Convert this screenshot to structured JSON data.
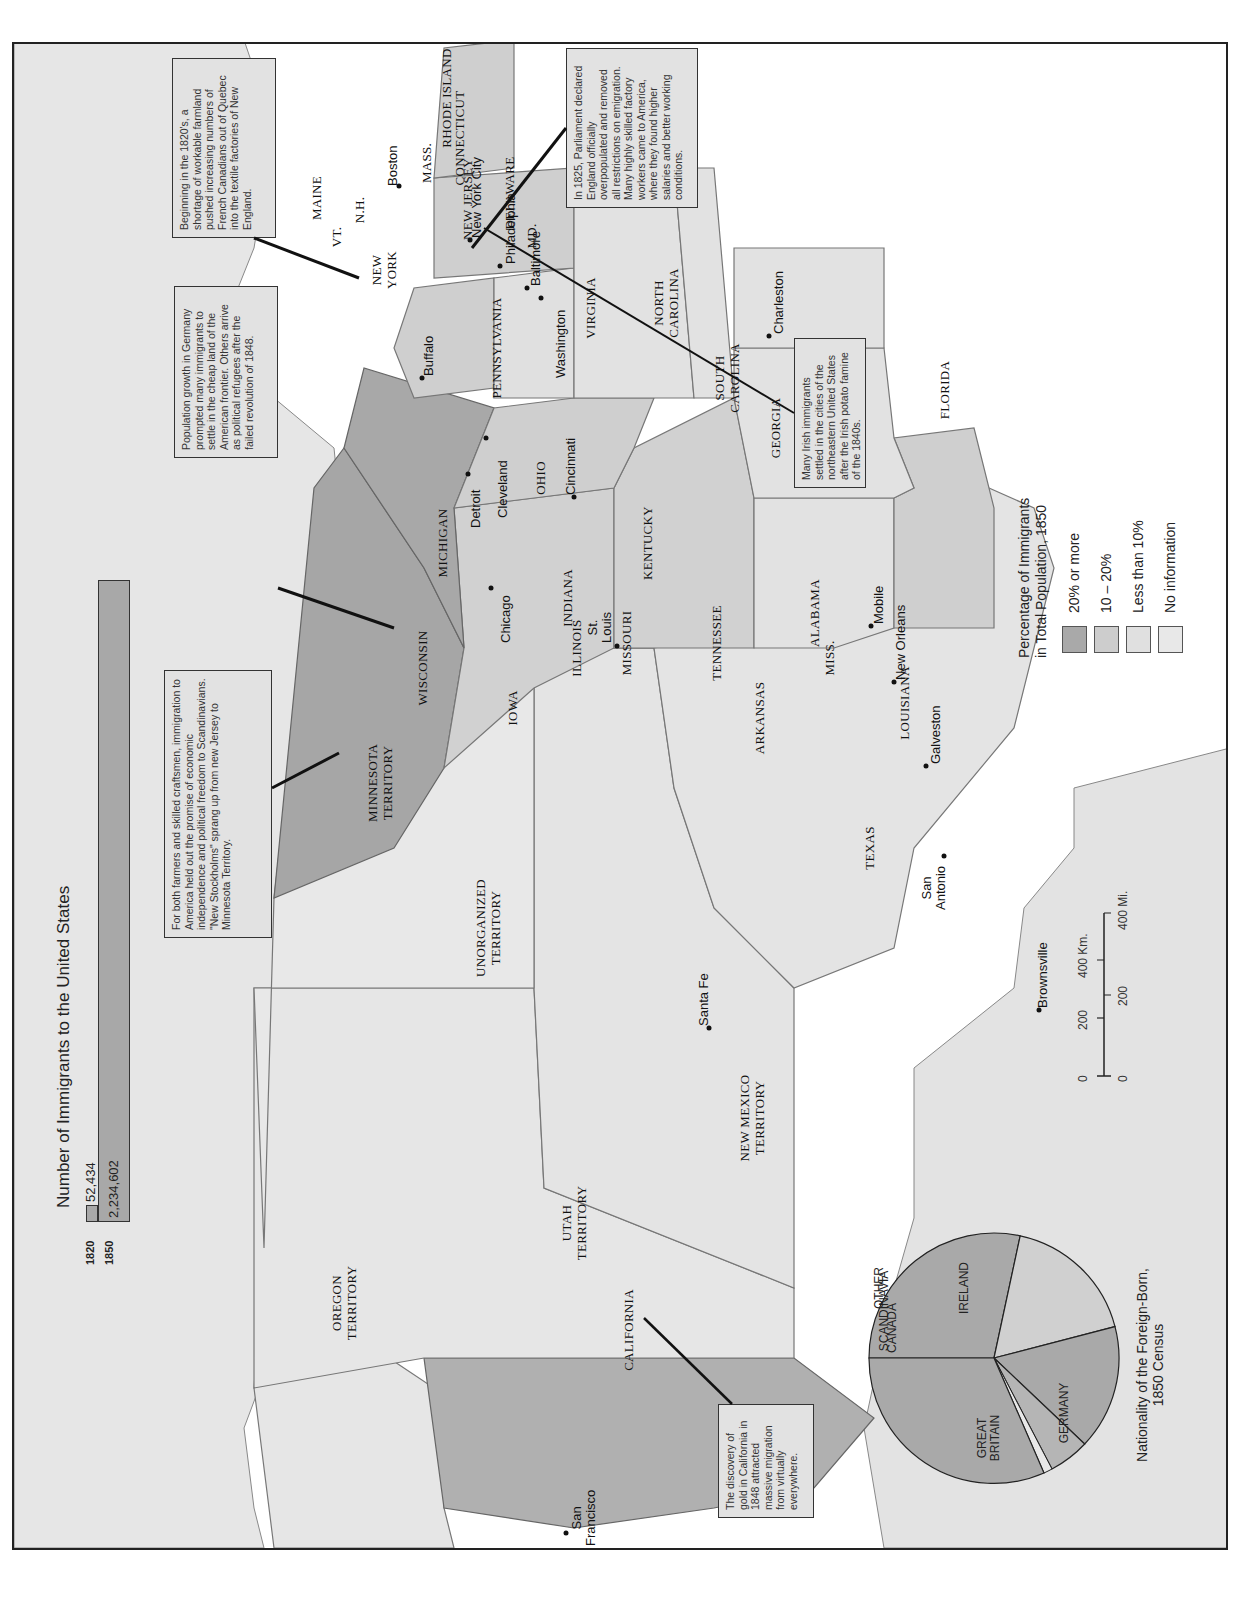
{
  "bar_chart": {
    "title": "Number of Immigrants to the United States",
    "bars": [
      {
        "year": "1820",
        "value_label": "52,434",
        "value": 52434
      },
      {
        "year": "1850",
        "value_label": "2,234,602",
        "value": 2234602
      }
    ]
  },
  "legend": {
    "title_line1": "Percentage of Immigrants",
    "title_line2": "in Total Population, 1850",
    "items": [
      {
        "label": "20% or more",
        "color": "#a9a9a9"
      },
      {
        "label": "10 – 20%",
        "color": "#cdcdcd"
      },
      {
        "label": "Less than 10%",
        "color": "#e0e0e0"
      },
      {
        "label": "No information",
        "color": "#e8e8e8"
      }
    ]
  },
  "scale": {
    "km_ticks": [
      "0",
      "200",
      "400 Km."
    ],
    "mi_ticks": [
      "0",
      "200",
      "400 Mi."
    ]
  },
  "pie_chart": {
    "title_line1": "Nationality of the Foreign-Born,",
    "title_line2": "1850 Census",
    "slices": [
      {
        "label": "IRELAND",
        "percent": 43
      },
      {
        "label": "GERMANY",
        "percent": 26
      },
      {
        "label": "GREAT BRITAIN",
        "percent": 17
      },
      {
        "label": "CANADA",
        "percent": 6
      },
      {
        "label": "SCANDINAVIA",
        "percent": 1
      },
      {
        "label": "OTHER",
        "percent": 7
      }
    ],
    "labels": {
      "ireland": "IRELAND",
      "germany": "GERMANY",
      "gb1": "GREAT",
      "gb2": "BRITAIN",
      "other": "OTHER",
      "scandinavia": "SCANDINAVIA",
      "canada": "CANADA"
    }
  },
  "states": {
    "maine": "MAINE",
    "nh": "N.H.",
    "vt": "VT.",
    "mass": "MASS.",
    "ri": "RHODE ISLAND",
    "ct": "CONNECTICUT",
    "ny1": "NEW",
    "ny2": "YORK",
    "nj": "NEW JERSEY",
    "de": "DELAWARE",
    "md": "MD.",
    "pa": "PENNSYLVANIA",
    "va": "VIRGINIA",
    "nc1": "NORTH",
    "nc2": "CAROLINA",
    "sc1": "SOUTH",
    "sc2": "CAROLINA",
    "ga": "GEORGIA",
    "fl": "FLORIDA",
    "oh": "OHIO",
    "mi": "MICHIGAN",
    "in": "INDIANA",
    "ky": "KENTUCKY",
    "tn": "TENNESSEE",
    "al": "ALABAMA",
    "ms": "MISS.",
    "la": "LOUISIANA",
    "ar": "ARKANSAS",
    "mo": "MISSOURI",
    "il": "ILLINOIS",
    "wi": "WISCONSIN",
    "ia": "IOWA",
    "mn1": "MINNESOTA",
    "mn2": "TERRITORY",
    "un1": "UNORGANIZED",
    "un2": "TERRITORY",
    "tx": "TEXAS",
    "nm1": "NEW MEXICO",
    "nm2": "TERRITORY",
    "ut1": "UTAH",
    "ut2": "TERRITORY",
    "or1": "OREGON",
    "or2": "TERRITORY",
    "ca": "CALIFORNIA"
  },
  "cities": {
    "boston": "Boston",
    "nyc": "New York City",
    "philadelphia": "Philadelphia",
    "baltimore": "Baltimore",
    "washington": "Washington",
    "buffalo": "Buffalo",
    "charleston": "Charleston",
    "cleveland": "Cleveland",
    "detroit": "Detroit",
    "cincinnati": "Cincinnati",
    "chicago": "Chicago",
    "stlouis1": "St.",
    "stlouis2": "Louis",
    "mobile": "Mobile",
    "neworleans": "New Orleans",
    "galveston": "Galveston",
    "brownsville": "Brownsville",
    "sanantonio1": "San",
    "sanantonio2": "Antonio",
    "santafe": "Santa Fe",
    "sanfrancisco1": "San",
    "sanfrancisco2": "Francisco"
  },
  "notes": {
    "quebec": "Beginning in the 1820's, a shortage of workable farmland pushed increasing numbers of French Canadians out of Quebec into the textile factories of New England.",
    "england": "In 1825, Parliament declared England officially overpopulated and removed all restrictions on emigration. Many highly skilled factory workers came to America, where they found higher salaries and better working conditions.",
    "irish": "Many Irish immigrants settled in the cities of the northeastern United States after the Irish potato famine of the 1840s.",
    "germany": "Population growth in Germany prompted many immigrants to settle in the cheap land of the American frontier. Others arrive as political refugees after the failed revolution of 1848.",
    "scandinavia": "For both farmers and skilled craftsmen, immigration to America held out the promise of economic independence and political freedom to Scandinavians. \"New Stockholms\" sprang up from new Jersey to Minnesota Territory.",
    "california": "The discovery of gold in California in 1848 attracted massive migration from virtually everywhere."
  }
}
